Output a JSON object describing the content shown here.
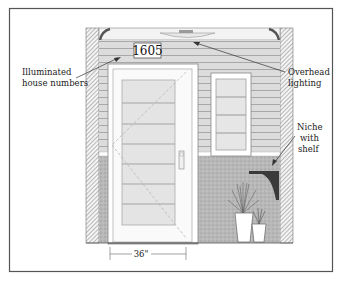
{
  "diagram": {
    "house_number": "1605",
    "callouts": {
      "house_numbers": {
        "line1": "Illuminated",
        "line2": "house numbers"
      },
      "overhead_lighting": {
        "line1": "Overhead",
        "line2": "lighting"
      },
      "niche": {
        "line1": "Niche",
        "line2": "with",
        "line3": "shelf"
      }
    },
    "dimension": {
      "door_width": "36\""
    },
    "colors": {
      "frame": "#555555",
      "siding": "#d9d9d9",
      "siding_line": "#a8a8a8",
      "wall_hatch": "#7a7a7a",
      "base": "#b5b5b5",
      "glass": "#e6e6e6",
      "shelf": "#3a3a3a"
    }
  }
}
